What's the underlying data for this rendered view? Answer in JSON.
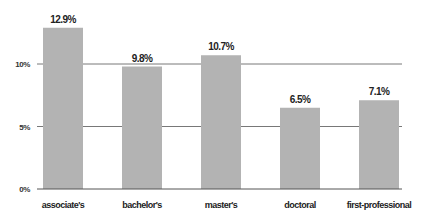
{
  "chart_data": {
    "type": "bar",
    "title": "",
    "xlabel": "",
    "ylabel": "",
    "categories": [
      "associate's",
      "bachelor's",
      "master's",
      "doctoral",
      "first-professional"
    ],
    "values": [
      12.9,
      9.8,
      10.7,
      6.5,
      7.1
    ],
    "value_labels": [
      "12.9%",
      "9.8%",
      "10.7%",
      "6.5%",
      "7.1%"
    ],
    "ylim": [
      0,
      13
    ],
    "yticks": [
      0,
      5,
      10
    ],
    "ytick_labels": [
      "0%",
      "5%",
      "10%"
    ],
    "grid": true,
    "legend": null,
    "colors": {
      "bar": "#b3b3b3",
      "grid": "#555555",
      "text": "#222222"
    }
  }
}
